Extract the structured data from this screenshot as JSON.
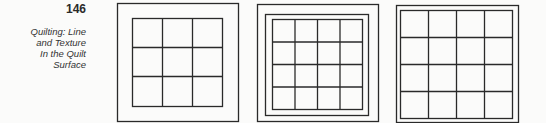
{
  "page": {
    "number": "146",
    "caption_lines": [
      "Quilting: Line",
      "and Texture",
      "In the Quilt",
      "Surface"
    ]
  },
  "figures": [
    {
      "name": "quilt-3x3-single-border",
      "grid": [
        3,
        3
      ]
    },
    {
      "name": "quilt-4x4-double-border",
      "grid": [
        4,
        4
      ]
    },
    {
      "name": "quilt-4x4-narrow-double-border",
      "grid": [
        4,
        4
      ]
    }
  ],
  "colors": {
    "ink": "#2a2a2a",
    "paper": "#fbfbfa"
  }
}
